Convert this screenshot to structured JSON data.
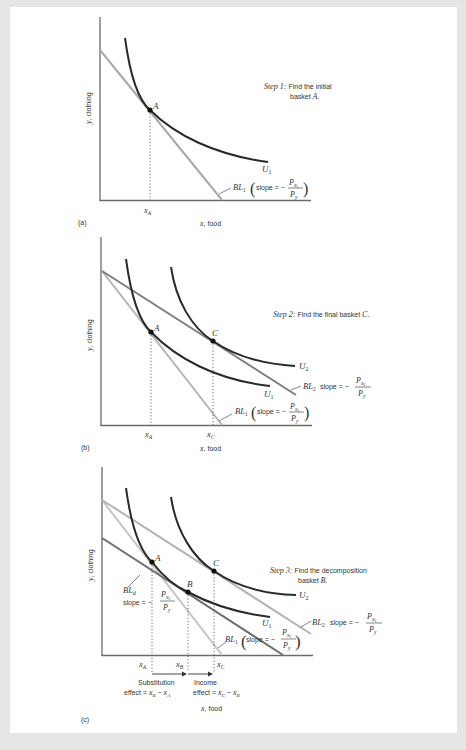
{
  "colors": {
    "background": "#e6e6e6",
    "sheet": "#ffffff",
    "axis": "#6b6b6b",
    "indifference_curve": "#2a2a2a",
    "bl1": "#a9a9a9",
    "bl1_light": "#c4c4c4",
    "bl2": "#7d7d7d",
    "bl2_light": "#b3b3b3",
    "bld": "#6e6e6e",
    "text": "#333333"
  },
  "panels": [
    {
      "id": "a",
      "label": "(a)",
      "y_axis_label": "y, clothing",
      "x_axis_label": "x, food",
      "step_title": "Step 1:",
      "step_text_line1": "Find the initial",
      "step_text_line2": "basket A.",
      "points": [
        {
          "name": "A"
        }
      ],
      "curves": [
        {
          "name": "U1",
          "label": "U₁"
        }
      ],
      "budget_lines": [
        {
          "name": "BL1",
          "label": "BL₁",
          "slope_label": "slope = −",
          "numerator": "Pₓ₁",
          "denominator": "P_y"
        }
      ],
      "ticks": [
        "x_A"
      ]
    },
    {
      "id": "b",
      "label": "(b)",
      "y_axis_label": "y, clothing",
      "x_axis_label": "x, food",
      "step_title": "Step 2:",
      "step_text_line1": "Find the final basket C.",
      "points": [
        {
          "name": "A"
        },
        {
          "name": "C"
        }
      ],
      "curves": [
        {
          "name": "U1",
          "label": "U₁"
        },
        {
          "name": "U2",
          "label": "U₂"
        }
      ],
      "budget_lines": [
        {
          "name": "BL1",
          "label": "BL₁",
          "slope_label": "slope = −",
          "numerator": "Pₓ₁",
          "denominator": "P_y"
        },
        {
          "name": "BL2",
          "label": "BL₂",
          "slope_label": "slope = −",
          "numerator": "Pₓ₂",
          "denominator": "P_y"
        }
      ],
      "ticks": [
        "x_A",
        "x_C"
      ]
    },
    {
      "id": "c",
      "label": "(c)",
      "y_axis_label": "y, clothing",
      "x_axis_label": "x, food",
      "step_title": "Step 3:",
      "step_text_line1": "Find the decomposition",
      "step_text_line2": "basket B.",
      "points": [
        {
          "name": "A"
        },
        {
          "name": "B"
        },
        {
          "name": "C"
        }
      ],
      "curves": [
        {
          "name": "U1",
          "label": "U₁"
        },
        {
          "name": "U2",
          "label": "U₂"
        }
      ],
      "budget_lines": [
        {
          "name": "BL1",
          "label": "BL₁",
          "slope_label": "slope = −",
          "numerator": "Pₓ₁",
          "denominator": "P_y"
        },
        {
          "name": "BL2",
          "label": "BL₂",
          "slope_label": "slope = −",
          "numerator": "Pₓ₂",
          "denominator": "P_y"
        },
        {
          "name": "BLd",
          "label": "BL_d",
          "slope_label": "slope = −",
          "numerator": "Pₓ₂",
          "denominator": "P_y"
        }
      ],
      "ticks": [
        "x_A",
        "x_B",
        "x_C"
      ],
      "effects": {
        "substitution_line1": "Substitution",
        "substitution_line2": "effect = x_B − x_A",
        "income_line1": "Income",
        "income_line2": "effect = x_C − x_B"
      }
    }
  ],
  "text": {
    "y_label": "y, clothing",
    "x_label": "x, food",
    "a_label": "(a)",
    "b_label": "(b)",
    "c_label": "(c)",
    "step1": "Step 1:",
    "step1_t1": "Find the initial",
    "step1_t2_pre": "basket ",
    "step1_t2_var": "A",
    "step1_t2_post": ".",
    "step2": "Step 2:",
    "step2_t1": "Find the final basket ",
    "step2_var": "C",
    "step2_post": ".",
    "step3": "Step 3:",
    "step3_t1": "Find the decomposition",
    "step3_t2_pre": "basket ",
    "step3_t2_var": "B",
    "step3_t2_post": ".",
    "A": "A",
    "B": "B",
    "C": "C",
    "U": "U",
    "sub1": "1",
    "sub2": "2",
    "BL": "BL",
    "d": "d",
    "slope_eq": "slope = −",
    "slope_eq_c": "slope =",
    "P": "P",
    "x": "x",
    "y": "y",
    "xA": "x",
    "A_sub": "A",
    "B_sub": "B",
    "C_sub": "C",
    "subst1": "Substitution",
    "subst2": "effect = ",
    "income1": "Income",
    "income2": "effect = ",
    "minus": " − "
  }
}
